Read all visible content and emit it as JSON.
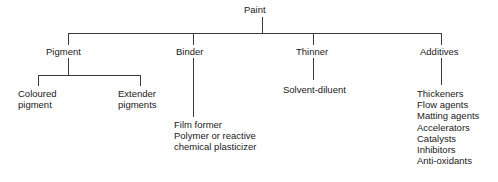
{
  "diagram": {
    "type": "tree",
    "line_color": "#3a3a3a",
    "text_color": "#1a1a1a",
    "background": "#ffffff",
    "root": {
      "label": "Paint"
    },
    "branches": [
      {
        "id": "pigment",
        "label": "Pigment",
        "children": [
          {
            "id": "coloured-pigment",
            "lines": [
              "Coloured",
              "pigment"
            ]
          },
          {
            "id": "extender-pigments",
            "lines": [
              "Extender",
              "pigments"
            ]
          }
        ]
      },
      {
        "id": "binder",
        "label": "Binder",
        "leaf_lines": [
          "Film former",
          "Polymer or reactive",
          "chemical plasticizer"
        ]
      },
      {
        "id": "thinner",
        "label": "Thinner",
        "leaf_lines": [
          "Solvent-diluent"
        ]
      },
      {
        "id": "additives",
        "label": "Additives",
        "leaf_lines": [
          "Thickeners",
          "Flow agents",
          "Matting agents",
          "Accelerators",
          "Catalysts",
          "Inhibitors",
          "Anti-oxidants"
        ]
      }
    ]
  }
}
